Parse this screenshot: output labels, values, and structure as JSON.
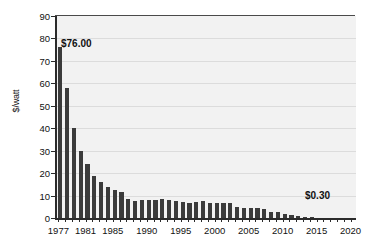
{
  "chart_data": {
    "type": "bar",
    "title": "",
    "subtitle": "",
    "xlabel": "",
    "ylabel": "$/watt",
    "ylim": [
      0,
      90
    ],
    "xlim": [
      1977,
      2020
    ],
    "ytick_step": 10,
    "yticks": [
      0,
      10,
      20,
      30,
      40,
      50,
      60,
      70,
      80,
      90
    ],
    "ytick_labels": [
      "0",
      "10",
      "20",
      "30",
      "40",
      "50",
      "60",
      "70",
      "80",
      "90"
    ],
    "xticks": [
      1977,
      1981,
      1985,
      1990,
      1995,
      2000,
      2005,
      2010,
      2015,
      2020
    ],
    "xtick_labels": [
      "1977",
      "1981",
      "1985",
      "1990",
      "1995",
      "2000",
      "2005",
      "2010",
      "2015",
      "2020"
    ],
    "grid": "horizontal",
    "legend": null,
    "legend_position": "none",
    "bar_color": "#3b3b3b",
    "plot_background": "#f2f2f2",
    "gridline_color": "#dcdcdc",
    "axis_color": "#2b2b2b",
    "categories": [
      1977,
      1978,
      1979,
      1980,
      1981,
      1982,
      1983,
      1984,
      1985,
      1986,
      1987,
      1988,
      1989,
      1990,
      1991,
      1992,
      1993,
      1994,
      1995,
      1996,
      1997,
      1998,
      1999,
      2000,
      2001,
      2002,
      2003,
      2004,
      2005,
      2006,
      2007,
      2008,
      2009,
      2010,
      2011,
      2012,
      2013,
      2014
    ],
    "values": [
      76,
      58,
      40,
      30,
      24,
      18.5,
      16,
      14,
      12.5,
      11.5,
      8.5,
      7.5,
      8,
      8,
      8,
      8.5,
      8,
      7.5,
      7,
      6.5,
      7,
      7.5,
      6.5,
      6.5,
      6.5,
      6.5,
      5,
      4.5,
      4.5,
      4.5,
      4,
      2.5,
      2.5,
      2,
      1.5,
      1,
      0.5,
      0.3
    ],
    "annotations": [
      {
        "text": "$76.00",
        "year": 1977,
        "value": 76
      },
      {
        "text": "$0.30",
        "year": 2014,
        "value": 0.3
      }
    ]
  }
}
